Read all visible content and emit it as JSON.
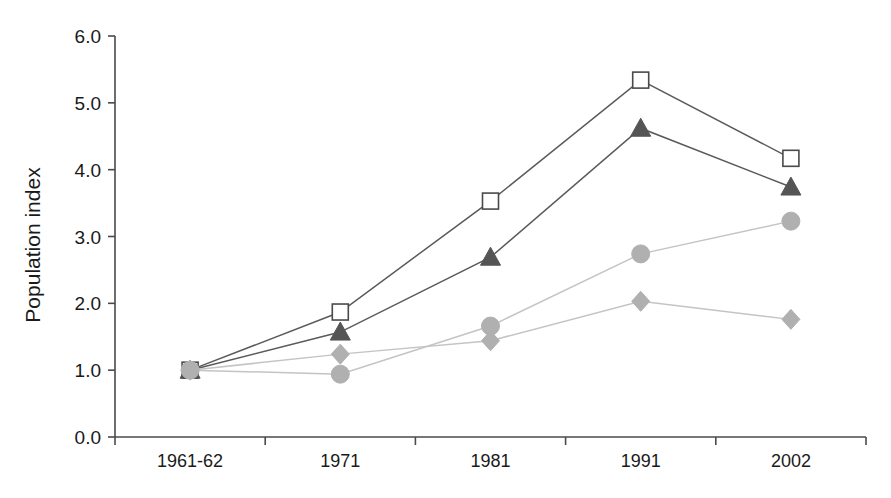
{
  "chart_data": {
    "type": "line",
    "title": "",
    "xlabel": "",
    "ylabel": "Population index",
    "categories": [
      "1961-62",
      "1971",
      "1981",
      "1991",
      "2002"
    ],
    "ylim": [
      0.0,
      6.0
    ],
    "ytick_step": 1.0,
    "ytick_labels": [
      "0.0",
      "1.0",
      "2.0",
      "3.0",
      "4.0",
      "5.0",
      "6.0"
    ],
    "ytick_values": [
      0.0,
      1.0,
      2.0,
      3.0,
      4.0,
      5.0,
      6.0
    ],
    "grid": false,
    "legend": "none",
    "series": [
      {
        "name": "series-open-square",
        "marker": "open-square",
        "marker_fill": "#ffffff",
        "marker_stroke": "#4a4a4a",
        "line_color": "#5a5a5a",
        "values": [
          1.0,
          1.87,
          3.53,
          5.34,
          4.17
        ]
      },
      {
        "name": "series-filled-triangle",
        "marker": "filled-triangle",
        "marker_fill": "#555555",
        "marker_stroke": "#555555",
        "line_color": "#5a5a5a",
        "values": [
          1.0,
          1.57,
          2.69,
          4.62,
          3.74
        ]
      },
      {
        "name": "series-filled-circle",
        "marker": "filled-circle",
        "marker_fill": "#b0b0b0",
        "marker_stroke": "#b0b0b0",
        "line_color": "#c4c4c4",
        "values": [
          1.0,
          0.94,
          1.66,
          2.74,
          3.23
        ]
      },
      {
        "name": "series-filled-diamond",
        "marker": "filled-diamond",
        "marker_fill": "#b0b0b0",
        "marker_stroke": "#b0b0b0",
        "line_color": "#c4c4c4",
        "values": [
          1.0,
          1.24,
          1.44,
          2.03,
          1.76
        ]
      }
    ]
  },
  "axes": {
    "y_title": "Population index",
    "y_labels": [
      "6.0",
      "5.0",
      "4.0",
      "3.0",
      "2.0",
      "1.0",
      "0.0"
    ],
    "x_labels": [
      "1961-62",
      "1971",
      "1981",
      "1991",
      "2002"
    ]
  },
  "colors": {
    "axis": "#4a4a4a",
    "dark_line": "#5a5a5a",
    "light_line": "#c4c4c4",
    "dark_marker": "#555555",
    "light_marker": "#b0b0b0",
    "background": "#ffffff",
    "text": "#1a1a1a"
  }
}
